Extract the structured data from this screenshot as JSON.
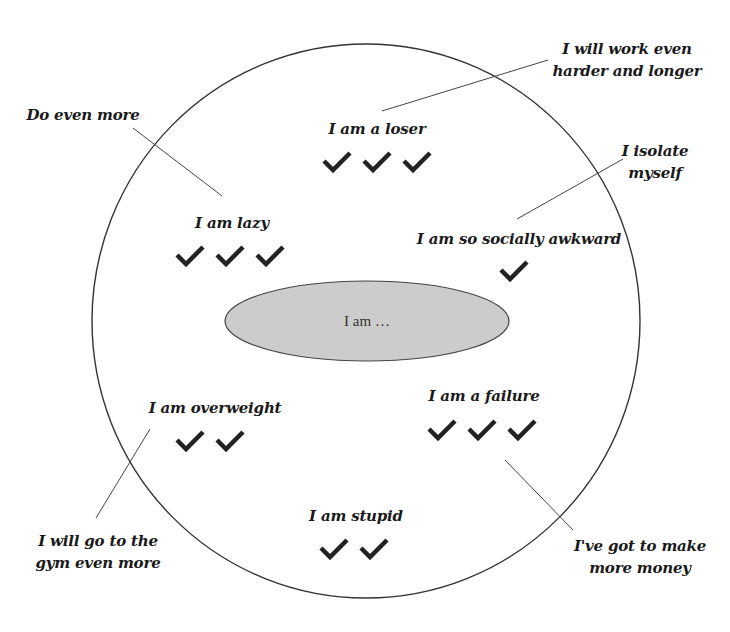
{
  "diagram": {
    "center": {
      "label": "I am …",
      "fill": "#cccccc"
    },
    "outer_circle": {
      "stroke": "#333333"
    },
    "beliefs": [
      {
        "label": "I am a loser",
        "checks": 3,
        "response": "I will work even harder and longer"
      },
      {
        "label": "I am lazy",
        "checks": 3,
        "response": "Do even more"
      },
      {
        "label": "I am so socially awkward",
        "checks": 1,
        "response": "I isolate myself"
      },
      {
        "label": "I am overweight",
        "checks": 2,
        "response": "I will go to the gym even more"
      },
      {
        "label": "I am a failure",
        "checks": 3,
        "response": "I've got to make more money"
      },
      {
        "label": "I am stupid",
        "checks": 2,
        "response": ""
      }
    ],
    "responses": {
      "work": {
        "line1": "I will work even",
        "line2": "harder and longer"
      },
      "do_more": {
        "line1": "Do even more"
      },
      "isolate": {
        "line1": "I isolate",
        "line2": "myself"
      },
      "gym": {
        "line1": "I will go to the",
        "line2": "gym even more"
      },
      "money": {
        "line1": "I've got to make",
        "line2": "more money"
      }
    },
    "check_icon": "check-mark-icon",
    "check_color": "#222222"
  }
}
